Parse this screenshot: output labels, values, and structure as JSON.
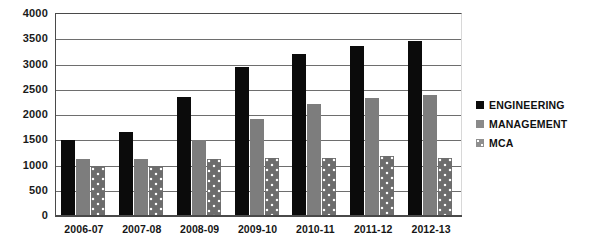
{
  "chart_data": {
    "type": "bar",
    "title": "",
    "subtitle": "",
    "xlabel": "",
    "ylabel": "",
    "ylim": [
      0,
      4000
    ],
    "ytick_step": 500,
    "yticks": [
      4000,
      3500,
      3000,
      2500,
      2000,
      1500,
      1000,
      500,
      0
    ],
    "grid": true,
    "legend_position": "right",
    "categories": [
      "2006-07",
      "2007-08",
      "2008-09",
      "2009-10",
      "2010-11",
      "2011-12",
      "2012-13"
    ],
    "series": [
      {
        "name": "ENGINEERING",
        "color": "#0b0b0b",
        "pattern": "solid",
        "values": [
          1500,
          1660,
          2350,
          2950,
          3200,
          3370,
          3470
        ]
      },
      {
        "name": "MANAGEMENT",
        "color": "#7d7d7d",
        "pattern": "solid",
        "values": [
          1120,
          1120,
          1500,
          1930,
          2210,
          2330,
          2400
        ]
      },
      {
        "name": "MCA",
        "color": "#6d6d6d",
        "pattern": "dotted",
        "values": [
          980,
          980,
          1120,
          1140,
          1150,
          1180,
          1150
        ]
      }
    ]
  },
  "legend": {
    "items": [
      {
        "label": "ENGINEERING",
        "marker": "square-black-icon"
      },
      {
        "label": "MANAGEMENT",
        "marker": "square-gray-icon"
      },
      {
        "label": "MCA",
        "marker": "square-dotted-icon"
      }
    ]
  }
}
